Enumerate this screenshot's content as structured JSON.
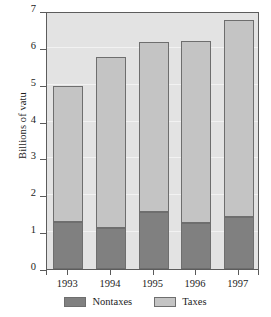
{
  "chart_data": {
    "type": "bar",
    "subtype": "stacked-vertical",
    "title": "",
    "xlabel": "",
    "ylabel": "Billions of vatu",
    "categories": [
      "1993",
      "1994",
      "1995",
      "1996",
      "1997"
    ],
    "series": [
      {
        "name": "Nontaxes",
        "color": "#808080",
        "values": [
          1.28,
          1.1,
          1.55,
          1.25,
          1.42
        ]
      },
      {
        "name": "Taxes",
        "color": "#c4c4c4",
        "values": [
          3.68,
          4.65,
          4.6,
          4.95,
          5.33
        ]
      }
    ],
    "totals": [
      4.96,
      5.75,
      6.15,
      6.2,
      6.75
    ],
    "ylim": [
      0,
      7
    ],
    "yticks": [
      0,
      1,
      2,
      3,
      4,
      5,
      6,
      7
    ],
    "ytick_labels": [
      "0",
      "1",
      "2",
      "3",
      "4",
      "5",
      "6",
      "7"
    ],
    "grid": true,
    "grid_color": "#f2f2f2",
    "plot_background": "#e3e3e3",
    "legend_position": "bottom",
    "legend": [
      {
        "label": "Nontaxes",
        "color": "#808080"
      },
      {
        "label": "Taxes",
        "color": "#c4c4c4"
      }
    ]
  }
}
